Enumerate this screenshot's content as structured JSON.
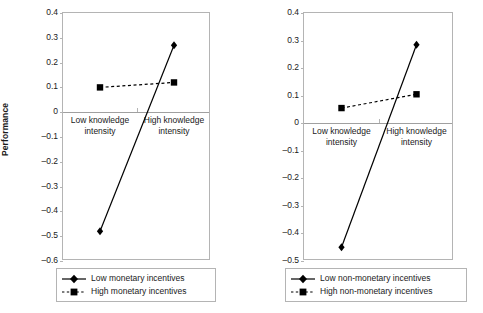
{
  "chart_data": [
    {
      "type": "line",
      "panel": "left",
      "title": "",
      "xlabel": "",
      "ylabel": "Performance",
      "categories": [
        "Low knowledge intensity",
        "High knowledge intensity"
      ],
      "category_lines": [
        [
          "Low knowledge",
          "intensity"
        ],
        [
          "High knowledge",
          "intensity"
        ]
      ],
      "ylim": [
        -0.6,
        0.4
      ],
      "yticks": [
        0.4,
        0.3,
        0.2,
        0.1,
        0,
        -0.1,
        -0.2,
        -0.3,
        -0.4,
        -0.5,
        -0.6
      ],
      "ytick_labels": [
        "0.4",
        "0.3",
        "0.2",
        "0.1",
        "0",
        "–0.1",
        "–0.2",
        "–0.3",
        "–0.4",
        "–0.5",
        "–0.6"
      ],
      "grid": false,
      "legend_position": "below",
      "series": [
        {
          "name": "Low monetary incentives",
          "marker": "diamond",
          "linestyle": "solid",
          "color": "#000000",
          "values": [
            -0.48,
            0.27
          ]
        },
        {
          "name": "High monetary incentives",
          "marker": "square",
          "linestyle": "dashed",
          "color": "#000000",
          "values": [
            0.1,
            0.12
          ]
        }
      ]
    },
    {
      "type": "line",
      "panel": "right",
      "title": "",
      "xlabel": "",
      "ylabel": "",
      "categories": [
        "Low knowledge intensity",
        "High knowledge intensity"
      ],
      "category_lines": [
        [
          "Low knowledge",
          "intensity"
        ],
        [
          "High knowledge",
          "intensity"
        ]
      ],
      "ylim": [
        -0.5,
        0.4
      ],
      "yticks": [
        0.4,
        0.3,
        0.2,
        0.1,
        0,
        -0.1,
        -0.2,
        -0.3,
        -0.4,
        -0.5
      ],
      "ytick_labels": [
        "0.4",
        "0.3",
        "0.2",
        "0.1",
        "0",
        "–0.1",
        "–0.2",
        "–0.3",
        "–0.4",
        "–0.5"
      ],
      "grid": false,
      "legend_position": "below",
      "series": [
        {
          "name": "Low non-monetary incentives",
          "marker": "diamond",
          "linestyle": "solid",
          "color": "#000000",
          "values": [
            -0.45,
            0.285
          ]
        },
        {
          "name": "High non-monetary incentives",
          "marker": "square",
          "linestyle": "dashed",
          "color": "#000000",
          "values": [
            0.055,
            0.105
          ]
        }
      ]
    }
  ],
  "left_panel": {
    "axis_title": "Performance",
    "ytick_labels": [
      "0.4",
      "0.3",
      "0.2",
      "0.1",
      "0",
      "–0.1",
      "–0.2",
      "–0.3",
      "–0.4",
      "–0.5",
      "–0.6"
    ],
    "xlabel_low_1": "Low knowledge",
    "xlabel_low_2": "intensity",
    "xlabel_high_1": "High knowledge",
    "xlabel_high_2": "intensity",
    "legend": {
      "item1": "Low monetary incentives",
      "item2": "High monetary incentives"
    }
  },
  "right_panel": {
    "ytick_labels": [
      "0.4",
      "0.3",
      "0.2",
      "0.1",
      "0",
      "–0.1",
      "–0.2",
      "–0.3",
      "–0.4",
      "–0.5"
    ],
    "xlabel_low_1": "Low knowledge",
    "xlabel_low_2": "intensity",
    "xlabel_high_1": "High knowledge",
    "xlabel_high_2": "intensity",
    "legend": {
      "item1": "Low non-monetary incentives",
      "item2": "High non-monetary incentives"
    }
  },
  "colors": {
    "series": "#000000",
    "frame": "#b4b4b4",
    "zero_line": "#a0a0a0",
    "text": "#1a1a1a",
    "background": "#ffffff"
  }
}
